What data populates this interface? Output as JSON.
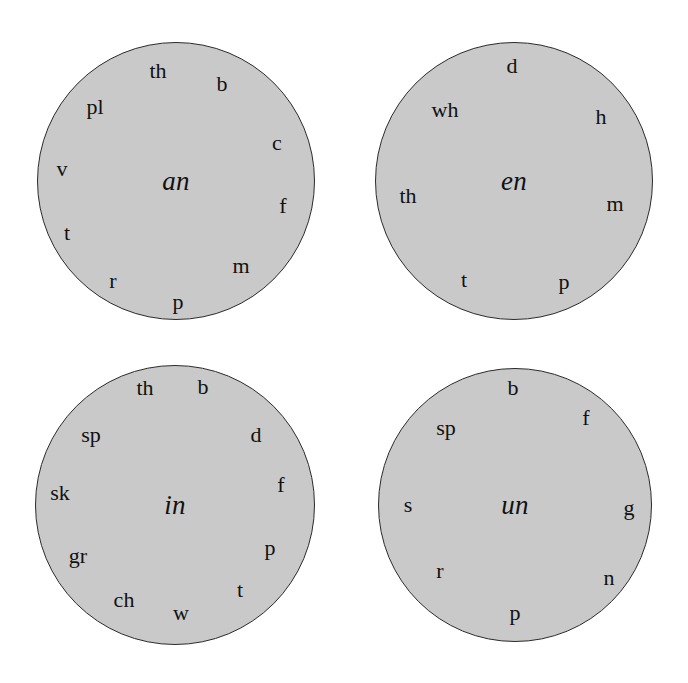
{
  "figure": {
    "type": "word-wheel-diagram",
    "background_color": "#ffffff",
    "wheel_fill_color": "#c9c9c9",
    "wheel_stroke_color": "#2b2b2b",
    "text_color": "#111111"
  },
  "wheels": [
    {
      "id": "wheel-an",
      "rime": "an",
      "center_x": 176,
      "center_y": 181,
      "radius": 139,
      "rime_font_size": 27,
      "onsets": [
        {
          "label": "th",
          "x": 158,
          "y": 71,
          "size": 22
        },
        {
          "label": "b",
          "x": 222,
          "y": 84,
          "size": 22
        },
        {
          "label": "pl",
          "x": 95,
          "y": 107,
          "size": 22
        },
        {
          "label": "c",
          "x": 277,
          "y": 143,
          "size": 22
        },
        {
          "label": "v",
          "x": 62,
          "y": 169,
          "size": 22
        },
        {
          "label": "f",
          "x": 283,
          "y": 206,
          "size": 22
        },
        {
          "label": "t",
          "x": 67,
          "y": 233,
          "size": 22
        },
        {
          "label": "m",
          "x": 241,
          "y": 266,
          "size": 22
        },
        {
          "label": "r",
          "x": 113,
          "y": 281,
          "size": 22
        },
        {
          "label": "p",
          "x": 178,
          "y": 302,
          "size": 22
        }
      ]
    },
    {
      "id": "wheel-en",
      "rime": "en",
      "center_x": 514,
      "center_y": 181,
      "radius": 139,
      "rime_font_size": 27,
      "onsets": [
        {
          "label": "d",
          "x": 512,
          "y": 66,
          "size": 22
        },
        {
          "label": "wh",
          "x": 445,
          "y": 110,
          "size": 22
        },
        {
          "label": "h",
          "x": 601,
          "y": 117,
          "size": 22
        },
        {
          "label": "th",
          "x": 408,
          "y": 196,
          "size": 22
        },
        {
          "label": "m",
          "x": 615,
          "y": 204,
          "size": 22
        },
        {
          "label": "t",
          "x": 464,
          "y": 280,
          "size": 22
        },
        {
          "label": "p",
          "x": 564,
          "y": 282,
          "size": 22
        }
      ]
    },
    {
      "id": "wheel-in",
      "rime": "in",
      "center_x": 175,
      "center_y": 505,
      "radius": 140,
      "rime_font_size": 27,
      "onsets": [
        {
          "label": "th",
          "x": 145,
          "y": 388,
          "size": 22
        },
        {
          "label": "b",
          "x": 203,
          "y": 387,
          "size": 22
        },
        {
          "label": "sp",
          "x": 91,
          "y": 435,
          "size": 22
        },
        {
          "label": "d",
          "x": 256,
          "y": 435,
          "size": 22
        },
        {
          "label": "sk",
          "x": 60,
          "y": 493,
          "size": 22
        },
        {
          "label": "f",
          "x": 281,
          "y": 485,
          "size": 22
        },
        {
          "label": "gr",
          "x": 78,
          "y": 556,
          "size": 22
        },
        {
          "label": "p",
          "x": 270,
          "y": 548,
          "size": 22
        },
        {
          "label": "ch",
          "x": 124,
          "y": 600,
          "size": 22
        },
        {
          "label": "t",
          "x": 240,
          "y": 590,
          "size": 22
        },
        {
          "label": "w",
          "x": 181,
          "y": 613,
          "size": 22
        }
      ]
    },
    {
      "id": "wheel-un",
      "rime": "un",
      "center_x": 515,
      "center_y": 505,
      "radius": 137,
      "rime_font_size": 27,
      "onsets": [
        {
          "label": "b",
          "x": 513,
          "y": 388,
          "size": 22
        },
        {
          "label": "f",
          "x": 586,
          "y": 418,
          "size": 22
        },
        {
          "label": "sp",
          "x": 446,
          "y": 428,
          "size": 22
        },
        {
          "label": "s",
          "x": 408,
          "y": 505,
          "size": 22
        },
        {
          "label": "g",
          "x": 629,
          "y": 508,
          "size": 22
        },
        {
          "label": "r",
          "x": 440,
          "y": 571,
          "size": 22
        },
        {
          "label": "n",
          "x": 609,
          "y": 578,
          "size": 22
        },
        {
          "label": "p",
          "x": 515,
          "y": 613,
          "size": 22
        }
      ]
    }
  ]
}
